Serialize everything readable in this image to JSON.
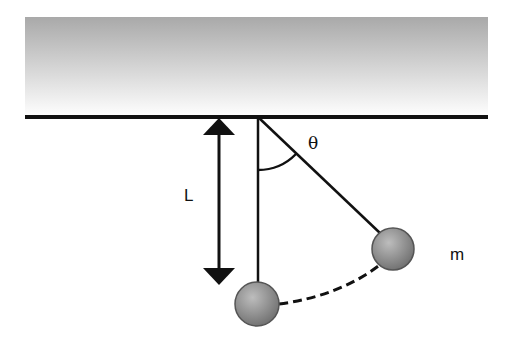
{
  "diagram": {
    "labels": {
      "angle": "θ",
      "length": "L",
      "mass": "m"
    },
    "colors": {
      "ceiling_top": "#a8a8a8",
      "ceiling_bottom": "#ffffff",
      "line": "#111111",
      "bob": "#8c8c8c"
    }
  }
}
